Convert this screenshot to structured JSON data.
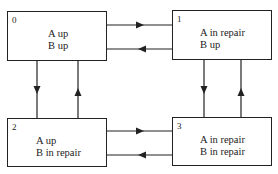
{
  "diagram": {
    "type": "state-transition",
    "states": [
      {
        "id": "0",
        "line1": "A up",
        "line2": "B up"
      },
      {
        "id": "1",
        "line1": "A in repair",
        "line2": "B up"
      },
      {
        "id": "2",
        "line1": "A up",
        "line2": "B in repair"
      },
      {
        "id": "3",
        "line1": "A in repair",
        "line2": "B in repair"
      }
    ],
    "transitions": [
      {
        "from": "0",
        "to": "1"
      },
      {
        "from": "1",
        "to": "0"
      },
      {
        "from": "0",
        "to": "2"
      },
      {
        "from": "2",
        "to": "0"
      },
      {
        "from": "1",
        "to": "3"
      },
      {
        "from": "3",
        "to": "1"
      },
      {
        "from": "2",
        "to": "3"
      },
      {
        "from": "3",
        "to": "2"
      }
    ],
    "colors": {
      "line": "#222222",
      "background": "#ffffff"
    }
  }
}
